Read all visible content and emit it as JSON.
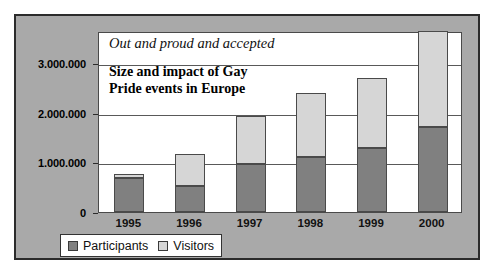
{
  "chart_data": {
    "type": "bar",
    "subtype": "stacked-column",
    "title": "Size and impact of Gay\nPride events in Europe",
    "title_lines": [
      "Size and impact of Gay",
      "Pride events in Europe"
    ],
    "subtitle": "Out and proud and accepted",
    "xlabel": "",
    "ylabel": "",
    "categories": [
      "1995",
      "1996",
      "1997",
      "1998",
      "1999",
      "2000"
    ],
    "series": [
      {
        "name": "Participants",
        "color": "#808080",
        "values": [
          680000,
          530000,
          975000,
          1110000,
          1300000,
          1720000
        ]
      },
      {
        "name": "Visitors",
        "color": "#d6d6d6",
        "values": [
          80000,
          640000,
          955000,
          1300000,
          1400000,
          1930000
        ]
      }
    ],
    "totals": [
      760000,
      1170000,
      1930000,
      2410000,
      2700000,
      3650000
    ],
    "ylim": [
      0,
      3650000
    ],
    "yticks": [
      0,
      1000000,
      2000000,
      3000000
    ],
    "ytick_labels": [
      "0",
      "1.000.000",
      "2.000.000",
      "3.000.000"
    ],
    "grid": true,
    "legend_position": "bottom-left",
    "panel_color": "#a9a9a9",
    "plot_background": "#ffffff"
  },
  "legend": {
    "items": [
      {
        "label": "Participants",
        "swatch": "#808080",
        "swatch_name": "participants-swatch"
      },
      {
        "label": "Visitors",
        "swatch": "#d6d6d6",
        "swatch_name": "visitors-swatch"
      }
    ]
  }
}
